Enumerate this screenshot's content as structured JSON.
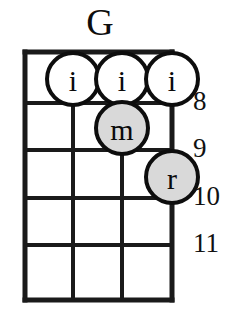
{
  "diagram": {
    "title": "G",
    "instrument_strings": 4,
    "type": "chord-diagram"
  },
  "fret_numbers": [
    {
      "label": "8",
      "y": 101
    },
    {
      "label": "9",
      "y": 148
    },
    {
      "label": "10",
      "y": 196
    },
    {
      "label": "11",
      "y": 243
    }
  ],
  "strings": {
    "x_positions": [
      25,
      73,
      122,
      172
    ]
  },
  "frets": {
    "y_positions": [
      52,
      103,
      150,
      198,
      245,
      300
    ]
  },
  "markers": [
    {
      "finger": "i",
      "string": 2,
      "fret": 1,
      "cx": 73,
      "cy": 79,
      "r": 26,
      "fill": "#ffffff"
    },
    {
      "finger": "i",
      "string": 3,
      "fret": 1,
      "cx": 122,
      "cy": 79,
      "r": 26,
      "fill": "#ffffff"
    },
    {
      "finger": "i",
      "string": 4,
      "fret": 1,
      "cx": 172,
      "cy": 79,
      "r": 26,
      "fill": "#ffffff"
    },
    {
      "finger": "m",
      "string": 3,
      "fret": 2,
      "cx": 122,
      "cy": 128,
      "r": 26,
      "fill": "#d9d9d9"
    },
    {
      "finger": "r",
      "string": 4,
      "fret": 3,
      "cx": 172,
      "cy": 177,
      "r": 26,
      "fill": "#d9d9d9"
    }
  ],
  "colors": {
    "ink": "#0d0d0d",
    "grid": "#1a1a1a",
    "marker_open": "#ffffff",
    "marker_filled": "#d9d9d9",
    "background": "#ffffff"
  }
}
